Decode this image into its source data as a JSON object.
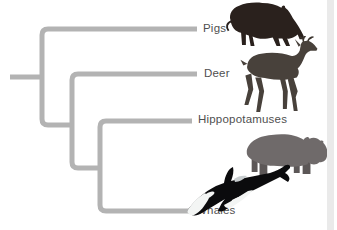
{
  "figure": {
    "type": "cladogram",
    "topology": "(Pigs, (Deer, (Hippopotamuses, Whales)))",
    "line_color": "#b3b3b3",
    "label_color": "#4f4f4f",
    "background": "#ffffff",
    "taxa": [
      {
        "label": "Pigs",
        "image": "wild-boar"
      },
      {
        "label": "Deer",
        "image": "deer"
      },
      {
        "label": "Hippopotamuses",
        "image": "hippopotamus"
      },
      {
        "label": "Whales",
        "image": "orca"
      }
    ]
  },
  "scrollbar": {
    "track_color": "#eaeaea"
  },
  "artwork": {
    "boar_color": "#2a211d",
    "deer_color": "#48413b",
    "deer_antler_color": "#3c352f",
    "hippo_body_color": "#6f6a6a",
    "hippo_leg_color": "#5c5757",
    "orca_body_color": "#0b0b0d",
    "orca_white_color": "#f3f5f4",
    "orca_saddle_color": "#c8cdcf"
  }
}
